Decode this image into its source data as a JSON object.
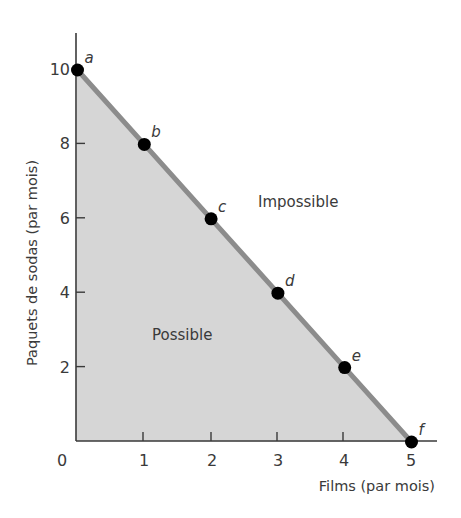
{
  "chart_data": {
    "type": "area",
    "title": "",
    "xlabel": "Films (par mois)",
    "ylabel": "Paquets de sodas (par mois)",
    "x_ticks": [
      "0",
      "1",
      "2",
      "3",
      "4",
      "5"
    ],
    "y_ticks": [
      "2",
      "4",
      "6",
      "8",
      "10"
    ],
    "xlim": [
      0,
      5.4
    ],
    "ylim": [
      0,
      10.7
    ],
    "grid": false,
    "legend": "none",
    "series": [
      {
        "name": "Frontière des possibilités de production",
        "points": [
          {
            "label": "a",
            "x": 0,
            "y": 10
          },
          {
            "label": "b",
            "x": 1,
            "y": 8
          },
          {
            "label": "c",
            "x": 2,
            "y": 6
          },
          {
            "label": "d",
            "x": 3,
            "y": 4
          },
          {
            "label": "e",
            "x": 4,
            "y": 2
          },
          {
            "label": "f",
            "x": 5,
            "y": 0
          }
        ]
      }
    ],
    "annotations": [
      {
        "text": "Impossible",
        "x": 3.3,
        "y": 6.3
      },
      {
        "text": "Possible",
        "x": 1.6,
        "y": 2.8
      }
    ],
    "colors": {
      "fill": "#d6d6d6",
      "line": "#8c8c8c",
      "point": "#000000",
      "axis": "#3a3a3a"
    }
  }
}
